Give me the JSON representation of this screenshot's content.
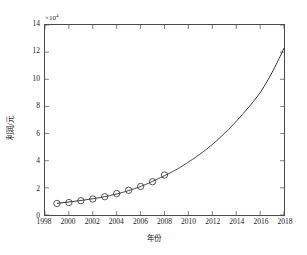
{
  "chart_data": {
    "type": "line",
    "title": "",
    "xlabel": "年份",
    "ylabel": "利润/元",
    "y_multiplier": "×10",
    "y_exponent": "4",
    "xlim": [
      1998,
      2018
    ],
    "ylim": [
      0,
      14
    ],
    "xticks": [
      1998,
      2000,
      2002,
      2004,
      2006,
      2008,
      2010,
      2012,
      2014,
      2016,
      2018
    ],
    "yticks": [
      0,
      2,
      4,
      6,
      8,
      10,
      12,
      14
    ],
    "grid": false,
    "legend": "none",
    "series": [
      {
        "name": "observed",
        "marker": "circle",
        "style": "markers",
        "color": "#2b2b2b",
        "x": [
          1999,
          2000,
          2001,
          2002,
          2003,
          2004,
          2005,
          2006,
          2007,
          2008
        ],
        "y": [
          0.85,
          0.92,
          1.05,
          1.18,
          1.35,
          1.58,
          1.82,
          2.1,
          2.45,
          2.95
        ]
      },
      {
        "name": "fitted-exponential",
        "marker": "none",
        "style": "line",
        "color": "#2b2b2b",
        "x": [
          1999,
          2000,
          2001,
          2002,
          2003,
          2004,
          2005,
          2006,
          2007,
          2008,
          2009,
          2010,
          2011,
          2012,
          2013,
          2014,
          2015,
          2016,
          2017,
          2018
        ],
        "y": [
          0.86,
          0.96,
          1.07,
          1.2,
          1.35,
          1.55,
          1.8,
          2.1,
          2.48,
          2.9,
          3.35,
          3.9,
          4.5,
          5.2,
          6.0,
          6.9,
          7.9,
          9.0,
          10.5,
          12.3
        ]
      }
    ]
  }
}
